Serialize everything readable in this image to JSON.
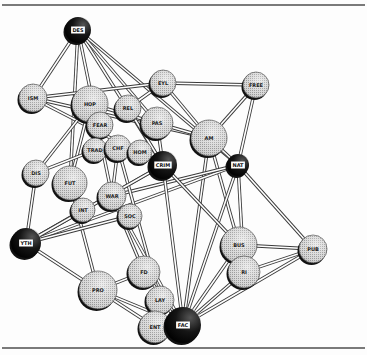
{
  "diagram": {
    "type": "network",
    "style": "shaded spheres connected by double-line tubes",
    "colors": {
      "light_node": "#cfcfcf",
      "light_node_shadow": "#2a2a2a",
      "dark_node": "#111111",
      "edge_outer": "#3a3a3a",
      "edge_inner": "#ffffff",
      "label_box_dark": "#ffffff",
      "label_text": "#222222"
    },
    "nodes": [
      {
        "id": "DES",
        "label": "DES",
        "x": 78,
        "y": 30,
        "r": 13,
        "dark": true
      },
      {
        "id": "EYL",
        "label": "EYL",
        "x": 163,
        "y": 83,
        "r": 13,
        "dark": false
      },
      {
        "id": "FREE",
        "label": "FREE",
        "x": 256,
        "y": 85,
        "r": 13,
        "dark": false
      },
      {
        "id": "ISM",
        "label": "ISM",
        "x": 33,
        "y": 98,
        "r": 14,
        "dark": false
      },
      {
        "id": "HOP",
        "label": "HOP",
        "x": 90,
        "y": 104,
        "r": 18,
        "dark": false
      },
      {
        "id": "REL",
        "label": "REL",
        "x": 128,
        "y": 108,
        "r": 13,
        "dark": false
      },
      {
        "id": "FEAR",
        "label": "FEAR",
        "x": 100,
        "y": 125,
        "r": 13,
        "dark": false
      },
      {
        "id": "PAS",
        "label": "PAS",
        "x": 157,
        "y": 123,
        "r": 16,
        "dark": false
      },
      {
        "id": "AM",
        "label": "AM",
        "x": 209,
        "y": 138,
        "r": 18,
        "dark": false
      },
      {
        "id": "TRAD",
        "label": "TRAD",
        "x": 95,
        "y": 150,
        "r": 12,
        "dark": false
      },
      {
        "id": "CHF",
        "label": "CHF",
        "x": 118,
        "y": 148,
        "r": 13,
        "dark": false
      },
      {
        "id": "HOM",
        "label": "HOM",
        "x": 140,
        "y": 152,
        "r": 12,
        "dark": false
      },
      {
        "id": "CRIM",
        "label": "CRIM",
        "x": 163,
        "y": 165,
        "r": 14,
        "dark": true
      },
      {
        "id": "NAT",
        "label": "NAT",
        "x": 238,
        "y": 165,
        "r": 11,
        "dark": true
      },
      {
        "id": "DIS",
        "label": "DIS",
        "x": 36,
        "y": 173,
        "r": 13,
        "dark": false
      },
      {
        "id": "FUT",
        "label": "FUT",
        "x": 70,
        "y": 183,
        "r": 17,
        "dark": false
      },
      {
        "id": "WAR",
        "label": "WAR",
        "x": 112,
        "y": 196,
        "r": 14,
        "dark": false
      },
      {
        "id": "INT",
        "label": "INT",
        "x": 83,
        "y": 210,
        "r": 12,
        "dark": false
      },
      {
        "id": "SOC",
        "label": "SOC",
        "x": 130,
        "y": 216,
        "r": 12,
        "dark": false
      },
      {
        "id": "YTH",
        "label": "YTH",
        "x": 26,
        "y": 243,
        "r": 15,
        "dark": true
      },
      {
        "id": "BUS",
        "label": "BUS",
        "x": 239,
        "y": 245,
        "r": 18,
        "dark": false
      },
      {
        "id": "PUB",
        "label": "PUB",
        "x": 313,
        "y": 249,
        "r": 14,
        "dark": false
      },
      {
        "id": "RI",
        "label": "RI",
        "x": 244,
        "y": 272,
        "r": 16,
        "dark": false
      },
      {
        "id": "FD",
        "label": "FD",
        "x": 144,
        "y": 272,
        "r": 16,
        "dark": false
      },
      {
        "id": "PRO",
        "label": "PRO",
        "x": 98,
        "y": 290,
        "r": 19,
        "dark": false
      },
      {
        "id": "LAY",
        "label": "LAY",
        "x": 160,
        "y": 300,
        "r": 14,
        "dark": false
      },
      {
        "id": "ENT",
        "label": "ENT",
        "x": 155,
        "y": 327,
        "r": 16,
        "dark": false
      },
      {
        "id": "FAC",
        "label": "FAC",
        "x": 183,
        "y": 325,
        "r": 18,
        "dark": true
      }
    ],
    "edges": [
      [
        "DES",
        "ISM"
      ],
      [
        "DES",
        "FUT"
      ],
      [
        "DES",
        "CRIM"
      ],
      [
        "DES",
        "NAT"
      ],
      [
        "DES",
        "WAR"
      ],
      [
        "DES",
        "PAS"
      ],
      [
        "ISM",
        "EYL"
      ],
      [
        "ISM",
        "CRIM"
      ],
      [
        "ISM",
        "AM"
      ],
      [
        "EYL",
        "FREE"
      ],
      [
        "EYL",
        "REL"
      ],
      [
        "EYL",
        "AM"
      ],
      [
        "FREE",
        "AM"
      ],
      [
        "FREE",
        "NAT"
      ],
      [
        "HOP",
        "AM"
      ],
      [
        "HOP",
        "FUT"
      ],
      [
        "HOP",
        "DIS"
      ],
      [
        "AM",
        "NAT"
      ],
      [
        "AM",
        "BUS"
      ],
      [
        "AM",
        "FAC"
      ],
      [
        "NAT",
        "FAC"
      ],
      [
        "NAT",
        "RI"
      ],
      [
        "NAT",
        "PUB"
      ],
      [
        "NAT",
        "YTH"
      ],
      [
        "NAT",
        "WAR"
      ],
      [
        "CRIM",
        "YTH"
      ],
      [
        "CRIM",
        "FAC"
      ],
      [
        "CRIM",
        "BUS"
      ],
      [
        "CRIM",
        "HOM"
      ],
      [
        "DIS",
        "TRAD"
      ],
      [
        "DIS",
        "YTH"
      ],
      [
        "FUT",
        "PRO"
      ],
      [
        "FUT",
        "INT"
      ],
      [
        "WAR",
        "FD"
      ],
      [
        "WAR",
        "FAC"
      ],
      [
        "CHF",
        "WAR"
      ],
      [
        "CHF",
        "LAY"
      ],
      [
        "SOC",
        "YTH"
      ],
      [
        "INT",
        "YTH"
      ],
      [
        "YTH",
        "PRO"
      ],
      [
        "YTH",
        "CRIM"
      ],
      [
        "PRO",
        "FD"
      ],
      [
        "PRO",
        "FAC"
      ],
      [
        "PRO",
        "ENT"
      ],
      [
        "FD",
        "FAC"
      ],
      [
        "LAY",
        "FAC"
      ],
      [
        "BUS",
        "PUB"
      ],
      [
        "BUS",
        "FAC"
      ],
      [
        "RI",
        "PUB"
      ],
      [
        "RI",
        "FAC"
      ],
      [
        "PUB",
        "FAC"
      ],
      [
        "HOM",
        "CRIM"
      ],
      [
        "REL",
        "CRIM"
      ],
      [
        "PAS",
        "CRIM"
      ]
    ]
  }
}
